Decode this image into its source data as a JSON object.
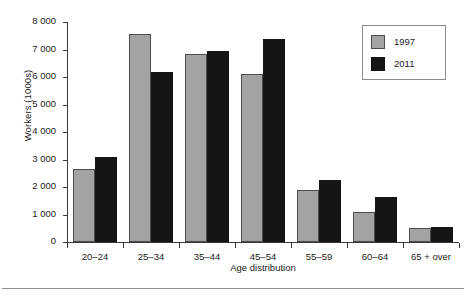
{
  "chart_data": {
    "type": "bar",
    "title": "",
    "xlabel": "Age distribution",
    "ylabel": "Workers (1000s)",
    "categories": [
      "20–24",
      "25–34",
      "35–44",
      "45–54",
      "55–59",
      "60–64",
      "65 + over"
    ],
    "series": [
      {
        "name": "1997",
        "color": "#a3a3a3",
        "values": [
          2650,
          7550,
          6830,
          6120,
          1880,
          1100,
          500
        ]
      },
      {
        "name": "2011",
        "color": "#151515",
        "values": [
          3100,
          6200,
          6940,
          7400,
          2250,
          1630,
          540
        ]
      }
    ],
    "ylim": [
      0,
      8000
    ],
    "ytick_values": [
      0,
      1000,
      2000,
      3000,
      4000,
      5000,
      6000,
      7000,
      8000
    ],
    "ytick_labels": [
      "0",
      "1 000",
      "2 000",
      "3 000",
      "4 000",
      "5 000",
      "6 000",
      "7 000",
      "8 000"
    ],
    "grid": false,
    "legend_position": "top-right",
    "legend_entries": [
      "1997",
      "2011"
    ]
  }
}
